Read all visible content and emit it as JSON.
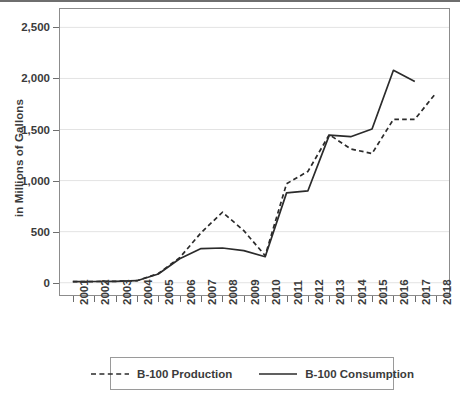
{
  "chart_data": {
    "type": "line",
    "title": "",
    "subtitle": "",
    "xlabel": "",
    "ylabel": "in Millions of Gallons",
    "x": [
      2001,
      2002,
      2003,
      2004,
      2005,
      2006,
      2007,
      2008,
      2009,
      2010,
      2011,
      2012,
      2013,
      2014,
      2015,
      2016,
      2017,
      2018
    ],
    "categories": [
      "2001",
      "2002",
      "2003",
      "2004",
      "2005",
      "2006",
      "2007",
      "2008",
      "2009",
      "2010",
      "2011",
      "2012",
      "2013",
      "2014",
      "2015",
      "2016",
      "2017",
      "2018"
    ],
    "xlim": [
      2000.4,
      2018.6
    ],
    "ylim": [
      -120,
      2680
    ],
    "yticks": [
      0,
      500,
      1000,
      1500,
      2000,
      2500
    ],
    "ytick_labels": [
      "0",
      "500",
      "1,000",
      "1,500",
      "2,000",
      "2,500"
    ],
    "grid": "horizontal",
    "legend_position": "bottom",
    "series": [
      {
        "name": "B-100 Production",
        "style": "dashed",
        "color": "#2b2b2b",
        "values": [
          10,
          12,
          14,
          20,
          90,
          245,
          490,
          690,
          510,
          265,
          970,
          1090,
          1450,
          1310,
          1265,
          1600,
          1600,
          1860
        ]
      },
      {
        "name": "B-100 Consumption",
        "style": "solid",
        "color": "#2b2b2b",
        "values": [
          10,
          12,
          14,
          20,
          85,
          235,
          335,
          340,
          315,
          255,
          880,
          900,
          1445,
          1430,
          1505,
          2080,
          1970,
          null
        ]
      }
    ]
  },
  "legend": {
    "items": [
      {
        "label": "B-100 Production",
        "style": "dashed"
      },
      {
        "label": "B-100 Consumption",
        "style": "solid"
      }
    ]
  },
  "axes": {
    "y_title": "in Millions of Gallons"
  }
}
